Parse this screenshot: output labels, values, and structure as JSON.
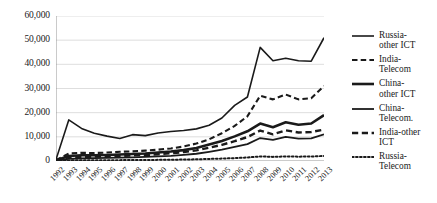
{
  "chart_data": {
    "type": "line",
    "title": "",
    "xlabel": "",
    "ylabel": "",
    "ylim": [
      0,
      60000
    ],
    "ytick_step": 10000,
    "grid": true,
    "legend_position": "right",
    "yticks": [
      "0",
      "10,000",
      "20,000",
      "30,000",
      "40,000",
      "50,000",
      "60,000"
    ],
    "ytick_values": [
      0,
      10000,
      20000,
      30000,
      40000,
      50000,
      60000
    ],
    "categories": [
      "1992",
      "1993",
      "1994",
      "1995",
      "1996",
      "1997",
      "1998",
      "1999",
      "2000",
      "2001",
      "2002",
      "2003",
      "2004",
      "2005",
      "2006",
      "2007",
      "2008",
      "2009",
      "2010",
      "2011",
      "2012",
      "2013"
    ],
    "series": [
      {
        "name": "Russia-other ICT",
        "style": "solid",
        "width": 1.6,
        "color": "#1a1a1a",
        "values": [
          600,
          17000,
          13500,
          11500,
          10300,
          9300,
          10900,
          10500,
          11600,
          12200,
          12600,
          13300,
          14800,
          17800,
          23000,
          26500,
          47000,
          41500,
          42500,
          41500,
          41300,
          51000
        ]
      },
      {
        "name": "India-Telecom",
        "style": "dashed",
        "width": 2.1,
        "color": "#1a1a1a",
        "values": [
          300,
          3100,
          3400,
          3300,
          3500,
          3800,
          4000,
          4300,
          4700,
          5200,
          6000,
          7200,
          9000,
          11500,
          14500,
          18500,
          27000,
          25500,
          27500,
          25500,
          26000,
          31000
        ]
      },
      {
        "name": "China-other ICT",
        "style": "solid",
        "width": 2.6,
        "color": "#1a1a1a",
        "values": [
          250,
          2100,
          2400,
          2400,
          2500,
          2700,
          2900,
          3100,
          3500,
          3900,
          4500,
          5400,
          6800,
          8300,
          10200,
          12300,
          15500,
          14000,
          16000,
          15000,
          15500,
          19000
        ]
      },
      {
        "name": "China-Telecom.",
        "style": "solid",
        "width": 1.8,
        "color": "#1a1a1a",
        "values": [
          150,
          900,
          1100,
          1200,
          1300,
          1400,
          1500,
          1700,
          1900,
          2100,
          2500,
          3000,
          3800,
          4700,
          5800,
          7000,
          9500,
          8700,
          10000,
          9300,
          9400,
          11000
        ]
      },
      {
        "name": "India-other ICT",
        "style": "dashed",
        "width": 2.4,
        "color": "#1a1a1a",
        "values": [
          200,
          1500,
          1700,
          1800,
          1900,
          2100,
          2300,
          2500,
          2800,
          3200,
          3700,
          4400,
          5500,
          6700,
          8200,
          9900,
          12600,
          11000,
          12700,
          11800,
          12000,
          13000
        ]
      },
      {
        "name": "Russia-Telecom",
        "style": "dotted",
        "width": 2.0,
        "color": "#1a1a1a",
        "values": [
          50,
          250,
          300,
          320,
          340,
          360,
          400,
          430,
          470,
          520,
          600,
          700,
          850,
          1000,
          1200,
          1450,
          1900,
          1700,
          1900,
          1800,
          1850,
          2100
        ]
      }
    ]
  },
  "legend": {
    "entries": [
      {
        "label": "Russia-\nother ICT"
      },
      {
        "label": "India-\nTelecom"
      },
      {
        "label": "China-\nother ICT"
      },
      {
        "label": "China-\nTelecom."
      },
      {
        "label": "India-other\nICT"
      },
      {
        "label": "Russia-\nTelecom"
      }
    ]
  }
}
